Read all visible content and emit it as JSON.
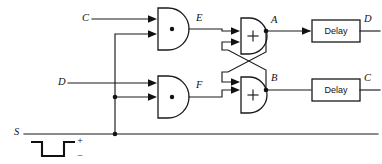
{
  "diagram": {
    "stroke_color": "#1a1a1a",
    "background_color": "#ffffff",
    "inputs": [
      {
        "name": "input-c",
        "label": "C"
      },
      {
        "name": "input-d",
        "label": "D"
      },
      {
        "name": "input-s",
        "label": "S"
      }
    ],
    "gates": [
      {
        "name": "and-gate-top",
        "symbol": "·",
        "type": "AND",
        "output_label": "E"
      },
      {
        "name": "and-gate-bottom",
        "symbol": "·",
        "type": "AND",
        "output_label": "F"
      },
      {
        "name": "or-gate-top",
        "symbol": "+",
        "type": "OR",
        "output_label": "A"
      },
      {
        "name": "or-gate-bottom",
        "symbol": "+",
        "type": "OR",
        "output_label": "B"
      }
    ],
    "signal_labels": {
      "and_top_out": "E",
      "and_bottom_out": "F",
      "or_top_out": "A",
      "or_bottom_out": "B",
      "delay_top_out": "D",
      "delay_bottom_out": "C"
    },
    "delays": [
      {
        "name": "delay-block-top",
        "label": "Delay",
        "output_label": "D"
      },
      {
        "name": "delay-block-bottom",
        "label": "Delay",
        "output_label": "C"
      }
    ],
    "waveform": {
      "name": "s-pulse-waveform",
      "description": "negative-going pulse",
      "plus_label": "+",
      "minus_label": "−"
    }
  }
}
